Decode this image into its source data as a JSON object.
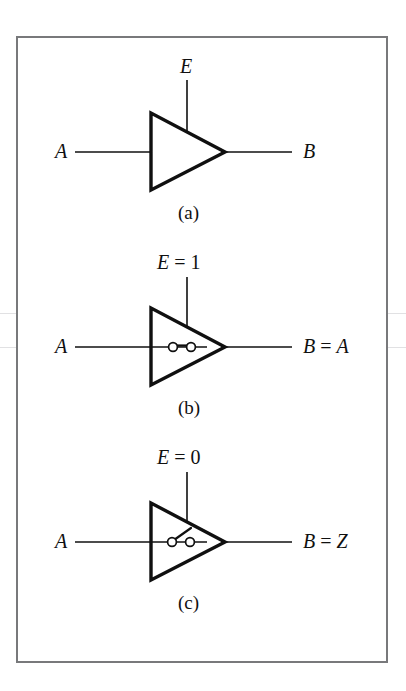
{
  "figure": {
    "background_color": "#ffffff",
    "frame_color": "#78797b",
    "ink_color": "#101010",
    "panels": [
      {
        "id": "a",
        "caption": "(a)",
        "enable_label": "E",
        "enable_var": "E",
        "enable_op": "",
        "enable_value": "",
        "input_label": "A",
        "output_var": "B",
        "output_op": "",
        "output_value": "",
        "switch_state": "none",
        "description": "tri-state-buffer-symbol"
      },
      {
        "id": "b",
        "caption": "(b)",
        "enable_label": "E = 1",
        "enable_var": "E",
        "enable_op": "=",
        "enable_value": "1",
        "input_label": "A",
        "output_var": "B",
        "output_op": "=",
        "output_value": "A",
        "switch_state": "closed",
        "description": "buffer-enabled-switch-closed"
      },
      {
        "id": "c",
        "caption": "(c)",
        "enable_label": "E = 0",
        "enable_var": "E",
        "enable_op": "=",
        "enable_value": "0",
        "input_label": "A",
        "output_var": "B",
        "output_op": "=",
        "output_value": "Z",
        "switch_state": "open",
        "description": "buffer-disabled-high-impedance"
      }
    ]
  }
}
